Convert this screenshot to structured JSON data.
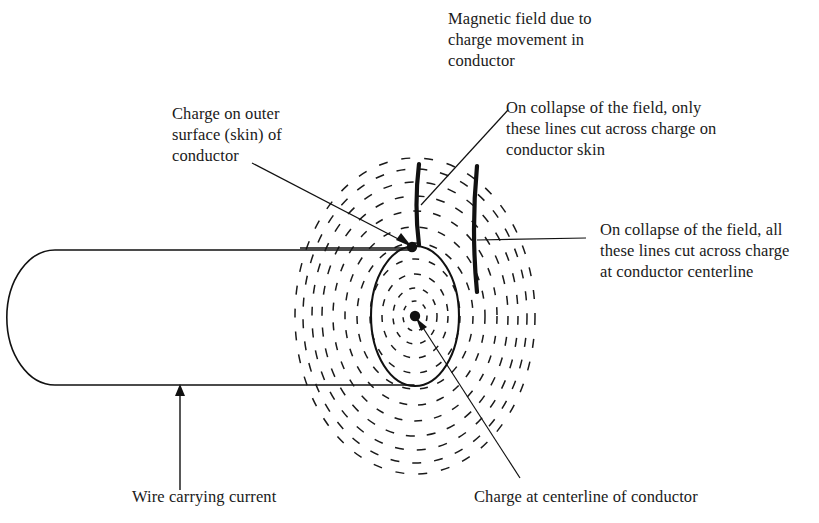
{
  "figure": {
    "type": "technical-diagram",
    "colors": {
      "ink": "#111111",
      "background": "#ffffff",
      "field_line": "#1a1a1a"
    }
  },
  "labels": {
    "magnetic_field": "Magnetic field due to\ncharge movement in\nconductor",
    "charge_outer_surface": "Charge on outer\nsurface (skin) of\nconductor",
    "collapse_skin": "On collapse of the field, only\nthese lines cut across charge on\nconductor skin",
    "collapse_centerline": "On collapse of the field, all\nthese lines cut across charge\nat conductor centerline",
    "wire_carrying_current": "Wire carrying current",
    "charge_at_centerline": "Charge at centerline of conductor"
  },
  "elements": {
    "conductor_body": "wire-cylinder",
    "conductor_end_face": "conductor-end-ellipse",
    "skin_charge_dot": "charge-dot-skin",
    "center_charge_dot": "charge-dot-center",
    "brace_inner": "field-brace-inner",
    "brace_outer": "field-brace-outer",
    "field_lines_count": 11
  }
}
